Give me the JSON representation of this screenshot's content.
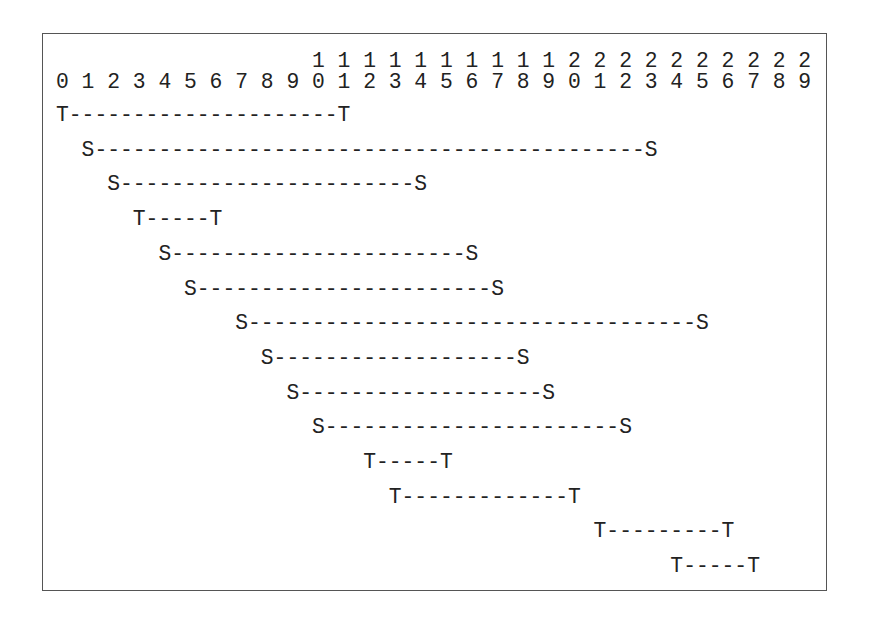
{
  "diagram": {
    "ruler": {
      "tens": "                    1 1 1 1 1 1 1 1 1 1 2 2 2 2 2 2 2 2 2 2",
      "units": "0 1 2 3 4 5 6 7 8 9 0 1 2 3 4 5 6 7 8 9 0 1 2 3 4 5 6 7 8 9"
    },
    "intervals": [
      {
        "type": "T",
        "start": 0,
        "end": 11,
        "text": "T---------------------T"
      },
      {
        "type": "S",
        "start": 1,
        "end": 23,
        "text": "  S-------------------------------------------S"
      },
      {
        "type": "S",
        "start": 2,
        "end": 14,
        "text": "    S-----------------------S"
      },
      {
        "type": "T",
        "start": 3,
        "end": 6,
        "text": "      T-----T"
      },
      {
        "type": "S",
        "start": 4,
        "end": 16,
        "text": "        S-----------------------S"
      },
      {
        "type": "S",
        "start": 5,
        "end": 17,
        "text": "          S-----------------------S"
      },
      {
        "type": "S",
        "start": 7,
        "end": 25,
        "text": "              S-----------------------------------S"
      },
      {
        "type": "S",
        "start": 8,
        "end": 18,
        "text": "                S-------------------S"
      },
      {
        "type": "S",
        "start": 9,
        "end": 19,
        "text": "                  S-------------------S"
      },
      {
        "type": "S",
        "start": 10,
        "end": 22,
        "text": "                    S-----------------------S"
      },
      {
        "type": "T",
        "start": 12,
        "end": 15,
        "text": "                        T-----T"
      },
      {
        "type": "T",
        "start": 13,
        "end": 20,
        "text": "                          T-------------T"
      },
      {
        "type": "T",
        "start": 21,
        "end": 26,
        "text": "                                          T---------T"
      },
      {
        "type": "T",
        "start": 24,
        "end": 27,
        "text": "                                                T-----T"
      }
    ]
  }
}
